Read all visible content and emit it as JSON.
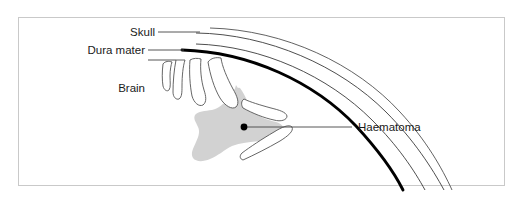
{
  "figure": {
    "background_color": "#ffffff",
    "frame_color": "#c9c9c9"
  },
  "labels": {
    "skull": "Skull",
    "dura_mater": "Dura mater",
    "brain": "Brain",
    "haematoma": "Haematoma"
  },
  "colors": {
    "haematoma_fill": "#d2d2d2",
    "dura_stroke": "#000000",
    "skull_stroke": "#3a3a3a",
    "brain_stroke": "#555555",
    "leader_stroke": "#444444",
    "marker_dot": "#000000",
    "text": "#1a1a1a"
  },
  "structures": [
    {
      "name": "skull-outer-table",
      "style": "thin-arc"
    },
    {
      "name": "skull-inner-table",
      "style": "thin-arc"
    },
    {
      "name": "dura-mater-arc",
      "style": "thick-arc"
    },
    {
      "name": "brain-gyri",
      "style": "thin-outline"
    },
    {
      "name": "haematoma-collection",
      "style": "grey-fill"
    }
  ],
  "marker": {
    "name": "haematoma-point",
    "description": "dot marking the haematoma collection"
  }
}
